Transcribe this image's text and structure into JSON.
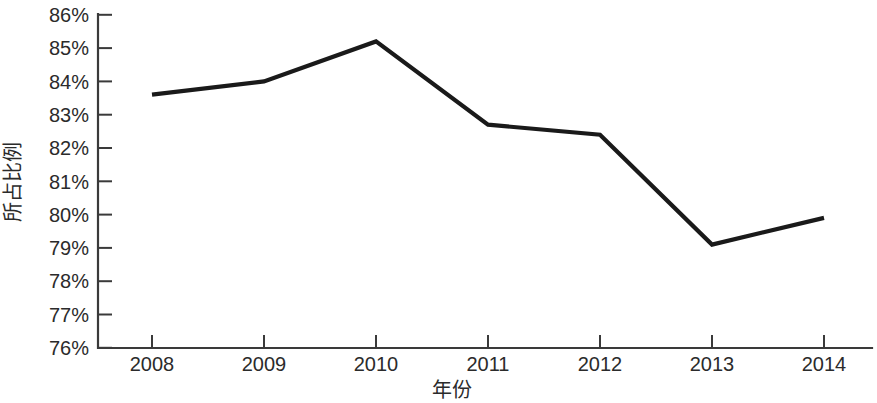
{
  "chart_data": {
    "type": "line",
    "title": "",
    "subtitle": "",
    "xlabel": "年份",
    "ylabel": "所占比例",
    "categories": [
      "2008",
      "2009",
      "2010",
      "2011",
      "2012",
      "2013",
      "2014"
    ],
    "x": [
      2008,
      2009,
      2010,
      2011,
      2012,
      2013,
      2014
    ],
    "values": [
      83.6,
      84.0,
      85.2,
      82.7,
      82.4,
      79.1,
      79.9
    ],
    "series": [
      {
        "name": "所占比例",
        "values": [
          83.6,
          84.0,
          85.2,
          82.7,
          82.4,
          79.1,
          79.9
        ]
      }
    ],
    "ylim": [
      76,
      86
    ],
    "ytick_labels": [
      "86%",
      "85%",
      "84%",
      "83%",
      "82%",
      "81%",
      "80%",
      "79%",
      "78%",
      "77%",
      "76%"
    ],
    "ytick_values": [
      86,
      85,
      84,
      83,
      82,
      81,
      80,
      79,
      78,
      77,
      76
    ],
    "xtick_labels": [
      "2008",
      "2009",
      "2010",
      "2011",
      "2012",
      "2013",
      "2014"
    ],
    "grid": false,
    "legend": false,
    "legend_position": "none",
    "line_color": "#1a1a1a",
    "axis_color": "#3a3a3a",
    "background_color": "#ffffff",
    "units": "%"
  }
}
